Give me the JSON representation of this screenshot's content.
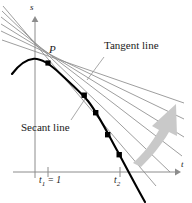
{
  "figure": {
    "kind": "calculus-tangent-secant-diagram",
    "axes": {
      "vertical_label": "s",
      "horizontal_label": "t",
      "origin_px": [
        35,
        172
      ],
      "vertical_axis_top_px": 18,
      "horizontal_axis_right_px": 178,
      "axis_color": "#8c8c8c"
    },
    "point_label": "P",
    "annotations": {
      "tangent": "Tangent line",
      "secant": "Secant line"
    },
    "ticks": [
      {
        "label_html": "t<sub>1</sub> = 1",
        "label_text": "t1 = 1",
        "x_px": 48
      },
      {
        "label_html": "t<sub>2</sub>",
        "label_text": "t2",
        "x_px": 120
      }
    ],
    "colors": {
      "curve": "#000000",
      "secant_lines": "#8c8c8c",
      "arrow": "#c9c9c9",
      "leader": "#9a9a9a",
      "text": "#1a1a1a"
    }
  },
  "chart_data": {
    "type": "line",
    "title": "",
    "xlabel": "t",
    "ylabel": "s",
    "grid": false,
    "legend": "none",
    "xlim": [
      0,
      4.2
    ],
    "ylim": [
      -3.2,
      1.6
    ],
    "annotations": [
      "Tangent line",
      "Secant line",
      "P"
    ],
    "tick_labels": {
      "x": [
        "t1 = 1",
        "t2"
      ],
      "y": []
    },
    "series": [
      {
        "name": "position curve s(t)",
        "type": "curve",
        "color": "#000000",
        "points_px": [
          [
            13,
            73
          ],
          [
            20,
            65
          ],
          [
            27,
            60
          ],
          [
            35,
            59
          ],
          [
            42,
            60
          ],
          [
            48,
            63
          ],
          [
            57,
            70
          ],
          [
            66,
            79
          ],
          [
            75,
            88
          ],
          [
            85,
            96
          ],
          [
            96,
            113
          ],
          [
            108,
            135
          ],
          [
            120,
            155
          ],
          [
            130,
            173
          ],
          [
            138,
            188
          ],
          [
            145,
            201
          ]
        ]
      },
      {
        "name": "tangent line at P",
        "type": "line",
        "color": "#8c8c8c",
        "from_px": [
          2,
          37
        ],
        "to_px": [
          183,
          103
        ]
      },
      {
        "name": "secant lines through P",
        "type": "lines",
        "color": "#8c8c8c",
        "from_px": [
          48,
          63
        ],
        "to_px_list": [
          [
            184,
            118
          ],
          [
            184,
            136
          ],
          [
            184,
            155
          ],
          [
            184,
            172
          ],
          [
            183,
            186
          ]
        ],
        "back_px_list": [
          [
            1,
            28
          ],
          [
            1,
            22
          ],
          [
            1,
            16
          ],
          [
            1,
            11
          ],
          [
            2,
            40
          ]
        ]
      },
      {
        "name": "secant endpoints on curve",
        "type": "markers",
        "marker": "square",
        "color": "#000000",
        "points_px": [
          [
            85,
            96
          ],
          [
            96,
            113
          ],
          [
            108,
            135
          ],
          [
            120,
            155
          ]
        ]
      }
    ],
    "arrow": {
      "name": "limit-direction-arrow",
      "color": "#c9c9c9",
      "from_px": [
        136,
        159
      ],
      "to_px": [
        176,
        104
      ]
    },
    "leaders": [
      {
        "name": "tangent-leader",
        "from_px": [
          103,
          56
        ],
        "to_px": [
          87,
          79
        ]
      },
      {
        "name": "secant-leader",
        "from_px": [
          72,
          119
        ],
        "to_px": [
          84,
          100
        ]
      }
    ]
  }
}
